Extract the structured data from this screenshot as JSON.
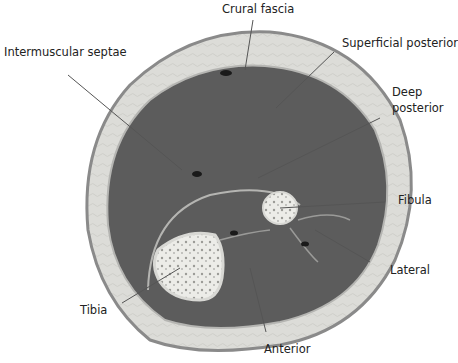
{
  "diagram": {
    "labels": {
      "crural_fascia": "Crural fascia",
      "intermuscular_septae": "Intermuscular septae",
      "superficial_posterior": "Superficial posterior",
      "deep_posterior_line1": "Deep",
      "deep_posterior_line2": "posterior",
      "fibula": "Fibula",
      "lateral": "Lateral",
      "tibia": "Tibia",
      "anterior": "Anterior"
    },
    "colors": {
      "muscle": "#5a5a5a",
      "fat_layer": "#d9d9d6",
      "skin_edge": "#8a8a8a",
      "bone": "#e8e8e4",
      "leader_line": "#555555"
    }
  }
}
